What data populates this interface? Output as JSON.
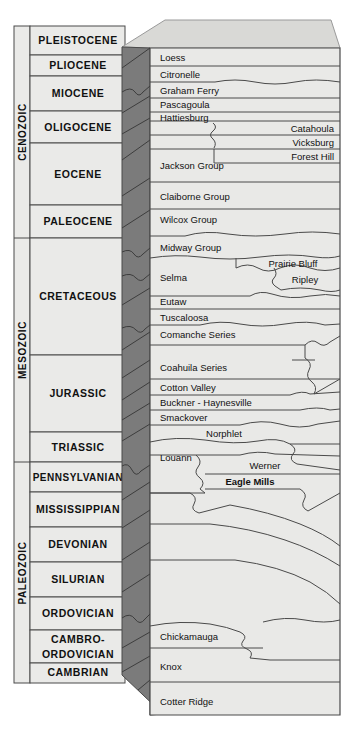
{
  "figure": {
    "type": "stratigraphic-column-block-diagram",
    "colors": {
      "front_face": "#e8e8e6",
      "left_face": "#7b7b7b",
      "top_face": "#d7d7d4",
      "column_fill": "#eaeae8",
      "line": "#4a4a4a",
      "text": "#111111",
      "background": "#ffffff"
    }
  },
  "era_column": {
    "items": [
      {
        "label": "CENOZOIC",
        "y_top": 26,
        "y_bottom": 238
      },
      {
        "label": "MESOZOIC",
        "y_top": 238,
        "y_bottom": 462
      },
      {
        "label": "PALEOZOIC",
        "y_top": 462,
        "y_bottom": 683
      }
    ]
  },
  "period_column": {
    "items": [
      {
        "label": "PLEISTOCENE",
        "y_top": 26,
        "y_bottom": 55
      },
      {
        "label": "PLIOCENE",
        "y_top": 55,
        "y_bottom": 76
      },
      {
        "label": "MIOCENE",
        "y_top": 76,
        "y_bottom": 111
      },
      {
        "label": "OLIGOCENE",
        "y_top": 111,
        "y_bottom": 143
      },
      {
        "label": "EOCENE",
        "y_top": 143,
        "y_bottom": 205
      },
      {
        "label": "PALEOCENE",
        "y_top": 205,
        "y_bottom": 238
      },
      {
        "label": "CRETACEOUS",
        "y_top": 238,
        "y_bottom": 355
      },
      {
        "label": "JURASSIC",
        "y_top": 355,
        "y_bottom": 432
      },
      {
        "label": "TRIASSIC",
        "y_top": 432,
        "y_bottom": 462
      },
      {
        "label": "PENNSYLVANIAN",
        "y_top": 462,
        "y_bottom": 492
      },
      {
        "label": "MISSISSIPPIAN",
        "y_top": 492,
        "y_bottom": 527
      },
      {
        "label": "DEVONIAN",
        "y_top": 527,
        "y_bottom": 562
      },
      {
        "label": "SILURIAN",
        "y_top": 562,
        "y_bottom": 597
      },
      {
        "label": "ORDOVICIAN",
        "y_top": 597,
        "y_bottom": 630
      },
      {
        "label": "CAMBRO-",
        "y_top": 630,
        "y_bottom": 663,
        "label2": "ORDOVICIAN"
      },
      {
        "label": "CAMBRIAN",
        "y_top": 663,
        "y_bottom": 683
      }
    ]
  },
  "units": {
    "left_aligned": [
      {
        "name": "Loess",
        "x": 160,
        "y": 58
      },
      {
        "name": "Citronelle",
        "x": 160,
        "y": 75
      },
      {
        "name": "Graham Ferry",
        "x": 160,
        "y": 91
      },
      {
        "name": "Pascagoula",
        "x": 160,
        "y": 105
      },
      {
        "name": "Hattiesburg",
        "x": 160,
        "y": 118
      },
      {
        "name": "Jackson Group",
        "x": 160,
        "y": 165
      },
      {
        "name": "Claiborne Group",
        "x": 160,
        "y": 197
      },
      {
        "name": "Wilcox Group",
        "x": 160,
        "y": 219
      },
      {
        "name": "Midway Group",
        "x": 160,
        "y": 249
      },
      {
        "name": "Selma",
        "x": 160,
        "y": 278
      },
      {
        "name": "Eutaw",
        "x": 160,
        "y": 301
      },
      {
        "name": "Tuscaloosa",
        "x": 160,
        "y": 317
      },
      {
        "name": "Comanche Series",
        "x": 160,
        "y": 334
      },
      {
        "name": "Coahuila Series",
        "x": 160,
        "y": 367
      },
      {
        "name": "Cotton Valley",
        "x": 160,
        "y": 387
      },
      {
        "name": "Buckner - Haynesville",
        "x": 160,
        "y": 403
      },
      {
        "name": "Smackover",
        "x": 160,
        "y": 418
      },
      {
        "name": "Louann",
        "x": 160,
        "y": 455
      }
    ],
    "right_aligned": [
      {
        "name": "Catahoula",
        "x": 330,
        "y": 128
      },
      {
        "name": "Vicksburg",
        "x": 330,
        "y": 143
      },
      {
        "name": "Forest Hill",
        "x": 330,
        "y": 156
      }
    ],
    "centered": [
      {
        "name": "Prairie Bluff",
        "x": 291,
        "y": 264
      },
      {
        "name": "Ripley",
        "x": 303,
        "y": 279
      },
      {
        "name": "Norphlet",
        "x": 222,
        "y": 433
      },
      {
        "name": "Werner",
        "x": 263,
        "y": 465
      }
    ],
    "bold_centered": [
      {
        "name": "Eagle Mills",
        "x": 248,
        "y": 481
      }
    ],
    "lower": [
      {
        "name": "Chickamauga",
        "x": 160,
        "y": 636
      },
      {
        "name": "Knox",
        "x": 160,
        "y": 667
      },
      {
        "name": "Cotter Ridge",
        "x": 160,
        "y": 701
      }
    ]
  }
}
